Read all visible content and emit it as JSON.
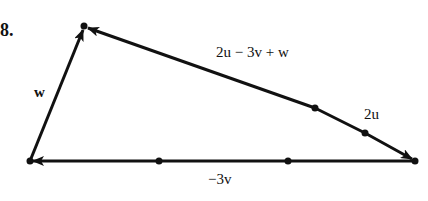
{
  "problem_number": "8.",
  "labels": {
    "w": "w",
    "resultant": "2u − 3v + w",
    "two_u": "2u",
    "neg_three_v": "−3v"
  },
  "points": {
    "left": [
      30,
      161
    ],
    "right": [
      415,
      161
    ],
    "top": [
      84,
      26
    ],
    "bottom_ticks": [
      [
        159,
        161
      ],
      [
        288,
        161
      ]
    ],
    "slant_ticks": [
      [
        315,
        108
      ],
      [
        365,
        133
      ]
    ]
  },
  "colors": {
    "stroke": "#111111",
    "background": "#ffffff"
  }
}
